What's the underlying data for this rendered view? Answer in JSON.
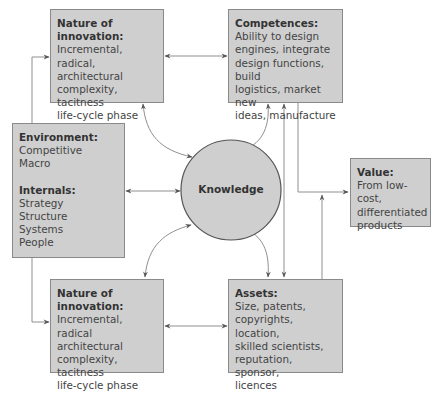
{
  "diagram": {
    "center": {
      "label": "Knowledge"
    },
    "innovation_top": {
      "title": "Nature of innovation:",
      "lines": [
        "Incremental, radical,",
        "architectural",
        "complexity, tacitness",
        "life-cycle phase"
      ]
    },
    "competences": {
      "title": "Competences:",
      "lines": [
        "Ability to design",
        "engines, integrate",
        "design functions, build",
        "logistics, market new",
        "ideas, manufacture"
      ]
    },
    "environment": {
      "title": "Environment:",
      "lines": [
        "Competitive",
        "Macro"
      ],
      "internals_title": "Internals:",
      "internals_lines": [
        "Strategy",
        "Structure",
        "Systems",
        "People"
      ]
    },
    "value": {
      "title": "Value:",
      "lines": [
        "From low-cost,",
        "differentiated",
        "products"
      ]
    },
    "innovation_bottom": {
      "title": "Nature of innovation:",
      "lines": [
        "Incremental, radical",
        "architectural",
        "complexity, tacitness",
        "life-cycle phase"
      ]
    },
    "assets": {
      "title": "Assets:",
      "lines": [
        "Size, patents,",
        "copyrights, location,",
        "skilled scientists,",
        "reputation, sponsor,",
        "licences"
      ]
    },
    "colors": {
      "box_fill": "#cfcfcf",
      "box_border": "#8a8a8a",
      "line": "#8a8a8a",
      "arrow": "#555555"
    }
  }
}
